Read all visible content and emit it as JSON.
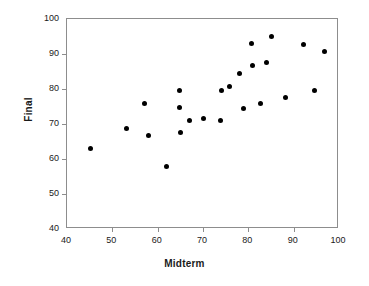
{
  "chart_data": {
    "type": "scatter",
    "title": "",
    "xlabel": "Midterm",
    "ylabel": "Final",
    "xlim": [
      40,
      100
    ],
    "ylim": [
      40,
      100
    ],
    "xticks": [
      40,
      50,
      60,
      70,
      80,
      90,
      100
    ],
    "yticks": [
      40,
      50,
      60,
      70,
      80,
      90,
      100
    ],
    "grid": false,
    "legend": null,
    "marker": "filled-circle",
    "marker_color": "#000000",
    "frame_color": "#8d8d8d",
    "points": [
      {
        "x": 45.1,
        "y": 62.9
      },
      {
        "x": 53.1,
        "y": 68.6
      },
      {
        "x": 57.2,
        "y": 76.0
      },
      {
        "x": 57.9,
        "y": 66.6
      },
      {
        "x": 61.9,
        "y": 57.9
      },
      {
        "x": 64.9,
        "y": 79.7
      },
      {
        "x": 64.9,
        "y": 74.6
      },
      {
        "x": 65.1,
        "y": 67.7
      },
      {
        "x": 67.1,
        "y": 70.9
      },
      {
        "x": 70.0,
        "y": 71.5
      },
      {
        "x": 73.9,
        "y": 70.9
      },
      {
        "x": 74.0,
        "y": 79.7
      },
      {
        "x": 75.9,
        "y": 80.6
      },
      {
        "x": 78.1,
        "y": 84.3
      },
      {
        "x": 79.0,
        "y": 74.3
      },
      {
        "x": 80.6,
        "y": 93.1
      },
      {
        "x": 80.9,
        "y": 86.6
      },
      {
        "x": 82.6,
        "y": 76.0
      },
      {
        "x": 84.1,
        "y": 87.7
      },
      {
        "x": 85.1,
        "y": 95.1
      },
      {
        "x": 88.1,
        "y": 77.7
      },
      {
        "x": 92.1,
        "y": 92.6
      },
      {
        "x": 94.6,
        "y": 79.7
      },
      {
        "x": 96.9,
        "y": 90.6
      }
    ]
  }
}
